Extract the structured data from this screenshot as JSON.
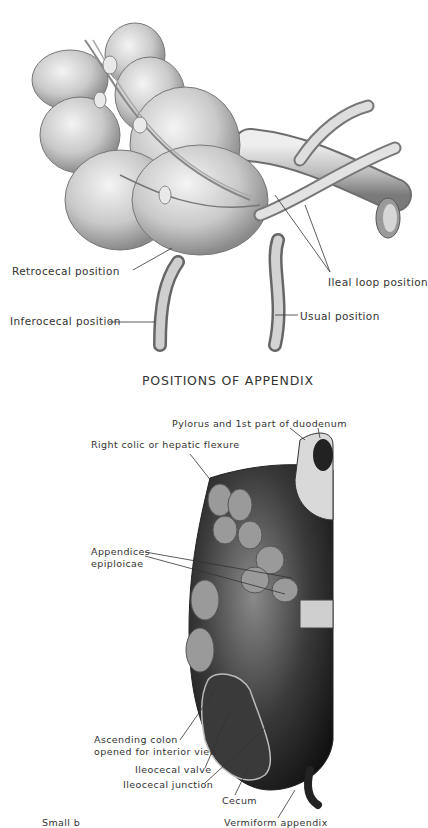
{
  "figure_top": {
    "caption": "POSITIONS OF APPENDIX",
    "labels": {
      "retrocecal": "Retrocecal position",
      "inferocecal": "Inferocecal position",
      "ileal_loop": "Ileal loop position",
      "usual": "Usual position"
    }
  },
  "figure_bottom": {
    "labels": {
      "pylorus": "Pylorus and 1st part of duodenum",
      "hepatic_flexure": "Right colic or hepatic flexure",
      "appendices_line1": "Appendices",
      "appendices_line2": "epiploicae",
      "ascending_line1": "Ascending colon",
      "ascending_line2": "opened for interior view",
      "ileocecal_valve": "Ileocecal valve",
      "ileocecal_junction": "Ileocecal junction",
      "cecum": "Cecum",
      "vermiform_partial": "Vermiform appendix",
      "left_partial": "Small b"
    }
  }
}
